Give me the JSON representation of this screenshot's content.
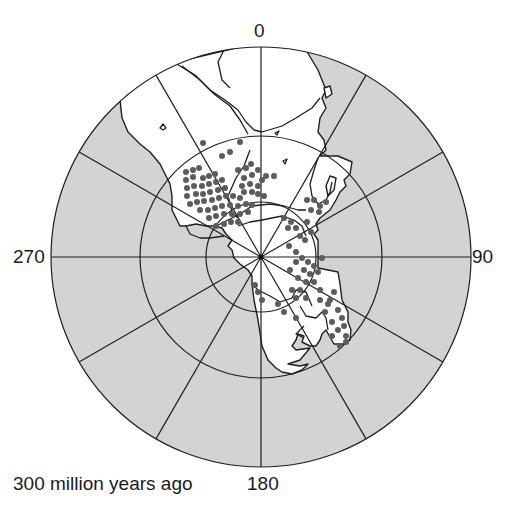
{
  "map": {
    "projection": "polar",
    "caption": "300 million years ago",
    "center": [
      261,
      257
    ],
    "rings": [
      55,
      121,
      210
    ],
    "spoke_interval_deg": 30,
    "longitude_labels": {
      "top": "0",
      "right": "90",
      "bottom": "180",
      "left": "270"
    },
    "colors": {
      "ocean": "#d3d3d3",
      "land": "#ffffff",
      "grid": "#1e1e1e",
      "coast": "#1e1e1e",
      "dots": "#5c5c5c"
    },
    "dot_radius": 3,
    "glacial_deposit_dots": [
      [
        203,
        143
      ],
      [
        240,
        142
      ],
      [
        222,
        156
      ],
      [
        230,
        152
      ],
      [
        251,
        164
      ],
      [
        252,
        175
      ],
      [
        258,
        170
      ],
      [
        186,
        172
      ],
      [
        193,
        170
      ],
      [
        199,
        168
      ],
      [
        186,
        180
      ],
      [
        193,
        177
      ],
      [
        203,
        178
      ],
      [
        209,
        176
      ],
      [
        215,
        174
      ],
      [
        187,
        188
      ],
      [
        194,
        186
      ],
      [
        202,
        186
      ],
      [
        209,
        184
      ],
      [
        216,
        182
      ],
      [
        222,
        180
      ],
      [
        187,
        196
      ],
      [
        196,
        194
      ],
      [
        203,
        194
      ],
      [
        210,
        192
      ],
      [
        218,
        190
      ],
      [
        225,
        188
      ],
      [
        190,
        204
      ],
      [
        197,
        202
      ],
      [
        204,
        201
      ],
      [
        212,
        200
      ],
      [
        219,
        198
      ],
      [
        226,
        196
      ],
      [
        233,
        196
      ],
      [
        240,
        198
      ],
      [
        200,
        210
      ],
      [
        208,
        210
      ],
      [
        215,
        208
      ],
      [
        222,
        206
      ],
      [
        230,
        205
      ],
      [
        238,
        206
      ],
      [
        246,
        204
      ],
      [
        252,
        205
      ],
      [
        209,
        218
      ],
      [
        216,
        216
      ],
      [
        224,
        214
      ],
      [
        232,
        214
      ],
      [
        240,
        214
      ],
      [
        248,
        212
      ],
      [
        216,
        226
      ],
      [
        224,
        224
      ],
      [
        231,
        222
      ],
      [
        238,
        222
      ],
      [
        246,
        168
      ],
      [
        238,
        170
      ],
      [
        244,
        178
      ],
      [
        250,
        184
      ],
      [
        242,
        186
      ],
      [
        258,
        186
      ],
      [
        262,
        180
      ],
      [
        266,
        176
      ],
      [
        244,
        192
      ],
      [
        252,
        192
      ],
      [
        258,
        194
      ],
      [
        264,
        196
      ],
      [
        274,
        176
      ],
      [
        307,
        200
      ],
      [
        314,
        200
      ],
      [
        320,
        206
      ],
      [
        326,
        202
      ],
      [
        311,
        210
      ],
      [
        319,
        212
      ],
      [
        284,
        218
      ],
      [
        291,
        222
      ],
      [
        296,
        228
      ],
      [
        288,
        228
      ],
      [
        300,
        236
      ],
      [
        307,
        222
      ],
      [
        311,
        232
      ],
      [
        305,
        240
      ],
      [
        289,
        246
      ],
      [
        296,
        252
      ],
      [
        302,
        258
      ],
      [
        308,
        262
      ],
      [
        314,
        266
      ],
      [
        296,
        262
      ],
      [
        304,
        270
      ],
      [
        310,
        274
      ],
      [
        290,
        270
      ],
      [
        298,
        278
      ],
      [
        306,
        282
      ],
      [
        314,
        282
      ],
      [
        320,
        290
      ],
      [
        318,
        272
      ],
      [
        322,
        258
      ],
      [
        292,
        290
      ],
      [
        300,
        290
      ],
      [
        296,
        298
      ],
      [
        306,
        298
      ],
      [
        320,
        300
      ],
      [
        328,
        304
      ],
      [
        334,
        292
      ],
      [
        338,
        310
      ],
      [
        342,
        318
      ],
      [
        344,
        326
      ],
      [
        346,
        336
      ],
      [
        338,
        330
      ],
      [
        332,
        322
      ],
      [
        332,
        336
      ],
      [
        255,
        285
      ],
      [
        258,
        292
      ],
      [
        262,
        300
      ],
      [
        284,
        312
      ],
      [
        278,
        304
      ],
      [
        296,
        318
      ],
      [
        340,
        346
      ],
      [
        346,
        342
      ],
      [
        330,
        300
      ],
      [
        325,
        312
      ]
    ]
  }
}
